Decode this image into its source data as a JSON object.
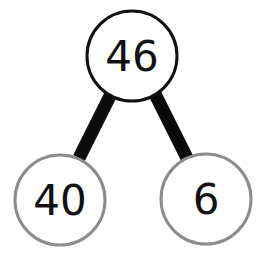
{
  "diagram": {
    "type": "number-bond",
    "whole": {
      "value": "46",
      "stroke": "#111111"
    },
    "parts": [
      {
        "value": "40",
        "stroke": "#8c8c8c"
      },
      {
        "value": "6",
        "stroke": "#8c8c8c"
      }
    ],
    "connector_color": "#0a0a0a"
  }
}
